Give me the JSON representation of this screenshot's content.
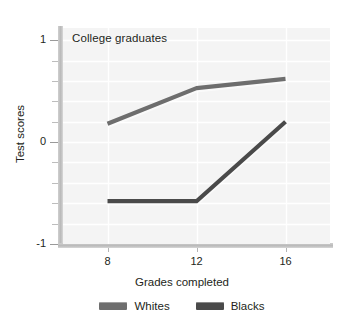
{
  "chart_data": {
    "type": "line",
    "title": "College graduates",
    "xlabel": "Grades completed",
    "ylabel": "Test scores",
    "x": [
      8,
      12,
      16
    ],
    "xtick_labels": [
      "8",
      "12",
      "16"
    ],
    "ytick_labels": [
      "1",
      "0",
      "-1"
    ],
    "ytick_values": [
      1,
      0,
      -1
    ],
    "xlim": [
      6,
      18
    ],
    "ylim": [
      -1,
      1.12
    ],
    "grid": "horizontal-and-vertical",
    "grid_color": "#ffffff",
    "gridline_step": 0.2,
    "plot_background": "#f4f4f4",
    "legend_position": "bottom-center",
    "series": [
      {
        "name": "Whites",
        "color": "#6e6e6e",
        "values": [
          0.18,
          0.53,
          0.62
        ]
      },
      {
        "name": "Blacks",
        "color": "#4a4a4a",
        "values": [
          -0.58,
          -0.58,
          0.2
        ]
      }
    ]
  },
  "legend": {
    "items": [
      {
        "label": "Whites",
        "color": "#6e6e6e"
      },
      {
        "label": "Blacks",
        "color": "#4a4a4a"
      }
    ]
  }
}
